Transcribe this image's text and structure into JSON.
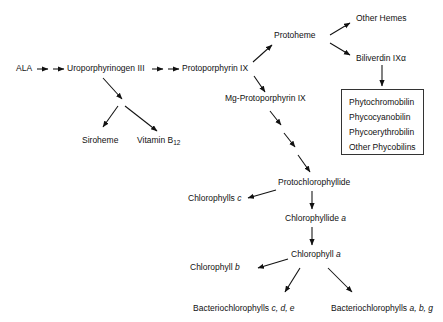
{
  "diagram": {
    "background_color": "#ffffff",
    "line_color": "#111111",
    "box_border_color": "#333333"
  },
  "nodes": {
    "ala": "ALA",
    "uroporphyrinogen_iii": "Uroporphyrinogen III",
    "siroheme": "Siroheme",
    "vitamin_b12_name": "Vitamin B",
    "vitamin_b12_sub": "12",
    "protoporphyrin_ix": "Protoporphyrin IX",
    "protoheme": "Protoheme",
    "other_hemes": "Other Hemes",
    "biliverdin": "Biliverdin IXα",
    "mg_protoporphyrin_ix": "Mg-Protoporphyrin IX",
    "protochlorophyllide": "Protochlorophyllide",
    "chlorophylls_c_name": "Chlorophylls ",
    "chlorophylls_c_italic": "c",
    "chlorophyllide_a_name": "Chlorophyllide ",
    "chlorophyllide_a_italic": "a",
    "chlorophyll_a_name": "Chlorophyll ",
    "chlorophyll_a_italic": "a",
    "chlorophyll_b_name": "Chlorophyll ",
    "chlorophyll_b_italic": "b",
    "bacteriochlorophylls_cde_name": "Bacteriochlorophylls ",
    "bacteriochlorophylls_cde_italic": "c, d, e",
    "bacteriochlorophylls_abg_name": "Bacteriochlorophylls ",
    "bacteriochlorophylls_abg_italic": "a, b, g"
  },
  "phycobilin_box": {
    "items": [
      "Phytochromobilin",
      "Phycocyanobilin",
      "Phycoerythrobilin",
      "Other Phycobilins"
    ]
  }
}
